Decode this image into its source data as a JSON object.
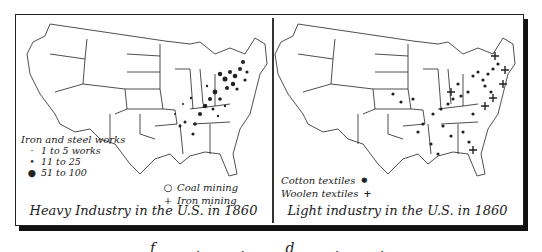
{
  "figure": {
    "panels": [
      {
        "id": "heavy",
        "caption": "Heavy Industry in the U.S. in 1860",
        "legend": {
          "title": "Iron and steel works",
          "size_classes": [
            {
              "label": "1 to 5 works",
              "symbol": "small-dot"
            },
            {
              "label": "11 to 25",
              "symbol": "medium-dot"
            },
            {
              "label": "51 to 100",
              "symbol": "large-dot"
            }
          ],
          "other": [
            {
              "label": "Coal mining",
              "symbol": "open-circle",
              "glyph": "○"
            },
            {
              "label": "Iron mining",
              "symbol": "cross",
              "glyph": "+"
            }
          ]
        }
      },
      {
        "id": "light",
        "caption": "Light industry in the U.S. in 1860",
        "legend": {
          "items": [
            {
              "label": "Cotton textiles",
              "symbol": "dot",
              "glyph": "●"
            },
            {
              "label": "Woolen textiles",
              "symbol": "cross",
              "glyph": "+"
            }
          ]
        }
      }
    ],
    "bottom_text_partial": "f . . d . ."
  },
  "colors": {
    "ink": "#222222",
    "background": "#ffffff",
    "shadow": "#111111"
  }
}
